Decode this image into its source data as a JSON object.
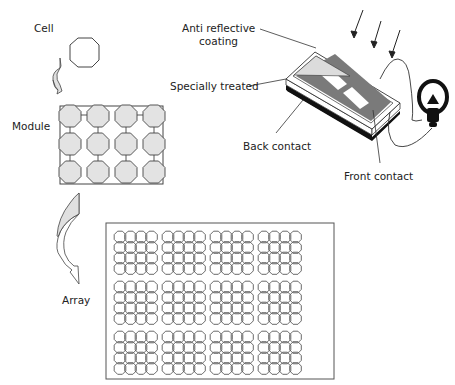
{
  "labels": {
    "cell": "Cell",
    "module": "Module",
    "array": "Array",
    "anti_reflective_1": "Anti reflective",
    "anti_reflective_2": "coating",
    "specially_treated": "Specially treated",
    "back_contact": "Back contact",
    "front_contact": "Front contact"
  },
  "colors": {
    "cell_fill": "#e3e3e3",
    "line": "#333333",
    "finger_gray": "#7a7a7a",
    "coating": "#dcdcdc",
    "back": "#111111"
  },
  "module": {
    "rows": 3,
    "cols": 4
  },
  "array": {
    "rows": 3,
    "cols": 4,
    "cells_per_block": "4x4"
  }
}
